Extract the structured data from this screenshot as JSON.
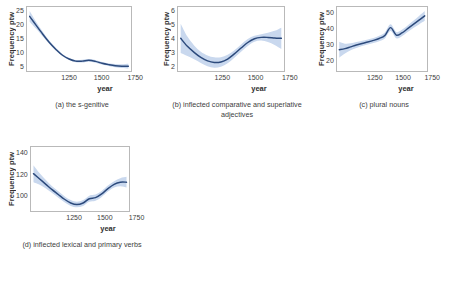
{
  "figure": {
    "background": "#ffffff",
    "line_color": "#2c4a7c",
    "band_color": "#c9d8ee",
    "frame_color": "#b9b9b9"
  },
  "chart_data": [
    {
      "type": "line",
      "id": "panel-a",
      "caption": "(a) the s-genitive",
      "title": "",
      "xlabel": "year",
      "ylabel": "Frequency ptw",
      "xlim": [
        1130,
        1920
      ],
      "ylim": [
        2.5,
        26.5
      ],
      "xticks": [
        1250,
        1500,
        1750
      ],
      "xticklabels": [
        "1250",
        "1500",
        "1750"
      ],
      "yticks": [
        25,
        20,
        15,
        10,
        5
      ],
      "yticklabels": [
        "25",
        "20",
        "15",
        "10",
        "5"
      ],
      "grid": false,
      "legend": "none",
      "x": [
        1150,
        1200,
        1250,
        1300,
        1350,
        1400,
        1450,
        1500,
        1550,
        1600,
        1650,
        1700,
        1750,
        1800,
        1850,
        1900
      ],
      "y": [
        23.0,
        19.6,
        16.3,
        13.2,
        10.6,
        8.4,
        7.0,
        6.2,
        6.2,
        6.5,
        6.1,
        5.4,
        4.9,
        4.5,
        4.3,
        4.3
      ],
      "band_lower": [
        21.0,
        18.3,
        15.4,
        12.6,
        10.1,
        8.0,
        6.6,
        5.8,
        5.7,
        6.0,
        5.6,
        4.9,
        4.4,
        3.9,
        3.6,
        3.4
      ],
      "band_upper": [
        25.0,
        20.9,
        17.2,
        13.8,
        11.1,
        8.8,
        7.4,
        6.6,
        6.7,
        7.0,
        6.6,
        5.9,
        5.4,
        5.1,
        5.0,
        5.2
      ]
    },
    {
      "type": "line",
      "id": "panel-b",
      "caption": "(b) inflected comparative and superlative adjectives",
      "title": "",
      "xlabel": "year",
      "ylabel": "Frequency ptw",
      "xlim": [
        1130,
        1920
      ],
      "ylim": [
        1.6,
        6.4
      ],
      "xticks": [
        1250,
        1500,
        1750
      ],
      "xticklabels": [
        "1250",
        "1500",
        "1750"
      ],
      "yticks": [
        6,
        5,
        4,
        3,
        2
      ],
      "yticklabels": [
        "6",
        "5",
        "4",
        "3",
        "2"
      ],
      "grid": false,
      "legend": "none",
      "x": [
        1150,
        1200,
        1250,
        1300,
        1350,
        1400,
        1450,
        1500,
        1550,
        1600,
        1650,
        1700,
        1750,
        1800,
        1850,
        1900
      ],
      "y": [
        4.05,
        3.45,
        3.0,
        2.62,
        2.36,
        2.24,
        2.28,
        2.5,
        2.88,
        3.32,
        3.74,
        4.02,
        4.12,
        4.12,
        4.08,
        4.05
      ],
      "band_lower": [
        2.95,
        2.72,
        2.48,
        2.2,
        1.95,
        1.85,
        1.92,
        2.18,
        2.6,
        3.05,
        3.48,
        3.8,
        3.88,
        3.78,
        3.55,
        3.25
      ],
      "band_upper": [
        5.15,
        4.18,
        3.52,
        3.04,
        2.77,
        2.63,
        2.64,
        2.82,
        3.16,
        3.59,
        4.0,
        4.24,
        4.36,
        4.46,
        4.61,
        4.85
      ]
    },
    {
      "type": "line",
      "id": "panel-c",
      "caption": "(c) plural nouns",
      "title": "",
      "xlabel": "year",
      "ylabel": "Frequency ptw",
      "xlim": [
        1130,
        1920
      ],
      "ylim": [
        16,
        52
      ],
      "xticks": [
        1250,
        1500,
        1750
      ],
      "xticklabels": [
        "1250",
        "1500",
        "1750"
      ],
      "yticks": [
        50,
        40,
        30,
        20
      ],
      "yticklabels": [
        "50",
        "40",
        "30",
        "20"
      ],
      "grid": false,
      "legend": "none",
      "x": [
        1150,
        1200,
        1250,
        1300,
        1350,
        1400,
        1450,
        1500,
        1550,
        1600,
        1650,
        1700,
        1750,
        1800,
        1850,
        1900
      ],
      "y": [
        28.0,
        28.6,
        29.6,
        30.6,
        31.5,
        32.3,
        33.2,
        34.3,
        36.0,
        40.4,
        36.2,
        37.4,
        39.8,
        42.2,
        44.6,
        47.0
      ],
      "band_lower": [
        23.5,
        25.8,
        27.6,
        28.9,
        30.0,
        30.9,
        31.8,
        32.8,
        34.3,
        38.5,
        34.4,
        35.6,
        38.0,
        40.2,
        42.2,
        44.2
      ],
      "band_upper": [
        32.5,
        31.4,
        31.6,
        32.3,
        33.0,
        33.7,
        34.6,
        35.8,
        37.7,
        42.3,
        38.0,
        39.2,
        41.6,
        44.2,
        47.0,
        49.8
      ]
    },
    {
      "type": "line",
      "id": "panel-d",
      "caption": "(d) inflected lexical and primary verbs",
      "title": "",
      "xlabel": "year",
      "ylabel": "Frequency ptw",
      "xlim": [
        1130,
        1920
      ],
      "ylim": [
        86,
        146
      ],
      "xticks": [
        1250,
        1500,
        1750
      ],
      "xticklabels": [
        "1250",
        "1500",
        "1750"
      ],
      "yticks": [
        140,
        120,
        100
      ],
      "yticklabels": [
        "140",
        "120",
        "100"
      ],
      "grid": false,
      "legend": "none",
      "x": [
        1150,
        1200,
        1250,
        1300,
        1350,
        1400,
        1450,
        1500,
        1550,
        1600,
        1650,
        1700,
        1750,
        1800,
        1850,
        1900
      ],
      "y": [
        121.0,
        116.0,
        111.0,
        106.0,
        101.5,
        97.0,
        93.5,
        92.0,
        93.5,
        97.5,
        98.5,
        102.0,
        107.0,
        111.0,
        113.0,
        113.0
      ],
      "band_lower": [
        113.0,
        110.5,
        107.0,
        102.8,
        98.5,
        94.2,
        90.8,
        89.4,
        90.8,
        94.6,
        95.6,
        99.2,
        104.2,
        108.0,
        109.2,
        108.0
      ],
      "band_upper": [
        129.0,
        121.5,
        115.0,
        109.2,
        104.5,
        99.8,
        96.2,
        94.6,
        96.2,
        100.4,
        101.4,
        104.8,
        109.8,
        114.0,
        116.8,
        118.0
      ]
    }
  ]
}
